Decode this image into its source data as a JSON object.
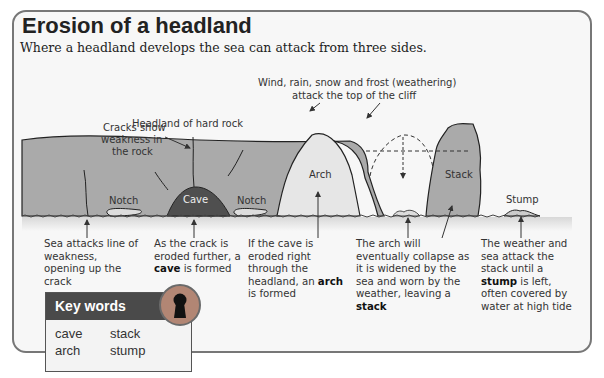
{
  "title": "Erosion of a headland",
  "subtitle": "Where a headland develops the sea can attack from three sides.",
  "colors": {
    "rock": "#aaaaaa",
    "cave": "#4f4f4f",
    "sky": "#f5f5f5",
    "keyhole_ring": "#b28674",
    "keywords_header": "#4a4a4a"
  },
  "diagram": {
    "labels": {
      "headland": "Headland of hard rock",
      "weathering_line1": "Wind, rain, snow and frost (weathering)",
      "weathering_line2": "attack the top of the cliff",
      "cracks_line1": "Cracks show",
      "cracks_line2": "weakness in",
      "cracks_line3": "the rock",
      "notch_left": "Notch",
      "cave": "Cave",
      "notch_right": "Notch",
      "arch": "Arch",
      "stack": "Stack",
      "stump": "Stump"
    }
  },
  "captions": [
    {
      "id": "sea-attacks",
      "parts": [
        "Sea attacks line of weakness, opening up the crack"
      ]
    },
    {
      "id": "cave-formed",
      "before": "As the crack is eroded further, a ",
      "bold": "cave",
      "after": " is formed"
    },
    {
      "id": "arch-formed",
      "before": "If the cave is eroded right through the headland, an ",
      "bold": "arch",
      "after": " is formed"
    },
    {
      "id": "stack-formed",
      "before": "The arch will eventually collapse as it is widened by the sea and worn by the weather, leaving a ",
      "bold": "stack",
      "after": ""
    },
    {
      "id": "stump-formed",
      "before": "The weather and sea attack the stack until a ",
      "bold": "stump",
      "after": " is left, often covered by water at high tide"
    }
  ],
  "key_words": {
    "heading": "Key words",
    "words": [
      "cave",
      "stack",
      "arch",
      "stump"
    ],
    "icon": "keyhole-icon"
  }
}
